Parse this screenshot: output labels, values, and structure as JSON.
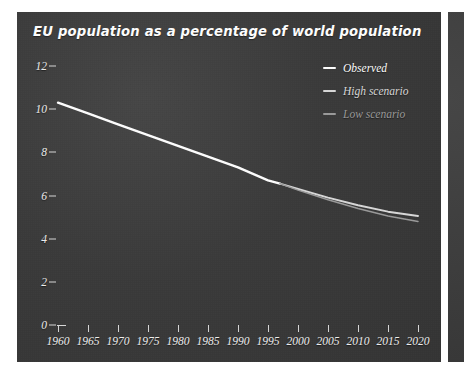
{
  "chart_data": {
    "type": "line",
    "title": "EU population as a percentage of world population",
    "xlabel": "",
    "ylabel": "",
    "xlim": [
      1960,
      2020
    ],
    "ylim": [
      0,
      12
    ],
    "grid": false,
    "legend_position": "top-right",
    "x_ticks": [
      1960,
      1965,
      1970,
      1975,
      1980,
      1985,
      1990,
      1995,
      2000,
      2005,
      2010,
      2015,
      2020
    ],
    "y_ticks": [
      0,
      2,
      4,
      6,
      8,
      10,
      12
    ],
    "series": [
      {
        "name": "Observed",
        "color": "#ffffff",
        "x": [
          1960,
          1965,
          1970,
          1975,
          1980,
          1985,
          1990,
          1995,
          1997
        ],
        "values": [
          10.3,
          9.8,
          9.3,
          8.8,
          8.3,
          7.8,
          7.3,
          6.7,
          6.55
        ]
      },
      {
        "name": "High scenario",
        "color": "#d9d9d9",
        "x": [
          1997,
          2000,
          2005,
          2010,
          2015,
          2020
        ],
        "values": [
          6.55,
          6.3,
          5.9,
          5.55,
          5.25,
          5.05
        ]
      },
      {
        "name": "Low scenario",
        "color": "#9a9a9a",
        "x": [
          1997,
          2000,
          2005,
          2010,
          2015,
          2020
        ],
        "values": [
          6.55,
          6.25,
          5.8,
          5.4,
          5.05,
          4.8
        ]
      }
    ]
  },
  "legend": {
    "items": [
      {
        "label": "Observed",
        "color": "#ffffff"
      },
      {
        "label": "High scenario",
        "color": "#d9d9d9"
      },
      {
        "label": "Low scenario",
        "color": "#9a9a9a"
      }
    ]
  },
  "colors": {
    "panel_background": "#3a3a3a",
    "page_background": "#ffffff",
    "axis": "#d8d8d8",
    "tick_label": "#efefef",
    "title": "#ffffff"
  }
}
